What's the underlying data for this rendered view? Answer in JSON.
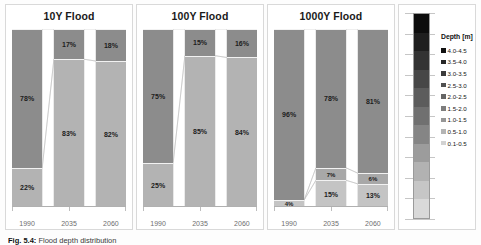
{
  "figure": {
    "caption_label": "Fig. 5.4:",
    "caption_text": "Flood depth distribution"
  },
  "chart_data": {
    "type": "bar",
    "subtype": "100% stacked column with connector ribbons",
    "title": "Flood depth distribution",
    "categories": [
      "1990",
      "2035",
      "2060"
    ],
    "xlabel": "",
    "ylabel": "",
    "ylim": [
      0,
      100
    ],
    "grid": false,
    "legend_position": "right",
    "panels": [
      {
        "title": "10Y Flood",
        "series": [
          {
            "name": "0.1-0.5",
            "values": [
              22,
              83,
              82
            ]
          },
          {
            "name": "0.5-1.0",
            "values": [
              78,
              17,
              18
            ]
          },
          {
            "name": "1.0-1.5",
            "values": [
              0,
              0,
              0
            ]
          }
        ],
        "bars": [
          {
            "category": "1990",
            "segments": [
              {
                "label": "0%",
                "value": 0,
                "color": "#808080",
                "outside": true
              },
              {
                "label": "78%",
                "value": 78,
                "color": "#8c8c8c"
              },
              {
                "label": "22%",
                "value": 22,
                "color": "#b3b3b3"
              }
            ]
          },
          {
            "category": "2035",
            "segments": [
              {
                "label": "0%",
                "value": 0,
                "color": "#808080",
                "outside": true
              },
              {
                "label": "17%",
                "value": 17,
                "color": "#8c8c8c"
              },
              {
                "label": "83%",
                "value": 83,
                "color": "#b3b3b3"
              }
            ]
          },
          {
            "category": "2060",
            "segments": [
              {
                "label": "0%",
                "value": 0,
                "color": "#808080",
                "outside": true
              },
              {
                "label": "18%",
                "value": 18,
                "color": "#8c8c8c"
              },
              {
                "label": "82%",
                "value": 82,
                "color": "#b3b3b3"
              }
            ]
          }
        ]
      },
      {
        "title": "100Y Flood",
        "series": [
          {
            "name": "0.1-0.5",
            "values": [
              25,
              85,
              84
            ]
          },
          {
            "name": "0.5-1.0",
            "values": [
              75,
              15,
              16
            ]
          },
          {
            "name": "1.0-1.5",
            "values": [
              0,
              0,
              0
            ]
          }
        ],
        "bars": [
          {
            "category": "1990",
            "segments": [
              {
                "label": "75%",
                "value": 75,
                "color": "#8c8c8c"
              },
              {
                "label": "25%",
                "value": 25,
                "color": "#b3b3b3"
              },
              {
                "label": "0%",
                "value": 0,
                "color": "#cfcfcf",
                "outside": true
              }
            ]
          },
          {
            "category": "2035",
            "segments": [
              {
                "label": "15%",
                "value": 15,
                "color": "#8c8c8c"
              },
              {
                "label": "85%",
                "value": 85,
                "color": "#b3b3b3"
              },
              {
                "label": "0%",
                "value": 0,
                "color": "#cfcfcf",
                "outside": true
              }
            ]
          },
          {
            "category": "2060",
            "segments": [
              {
                "label": "16%",
                "value": 16,
                "color": "#8c8c8c"
              },
              {
                "label": "84%",
                "value": 84,
                "color": "#b3b3b3"
              },
              {
                "label": "0%",
                "value": 0,
                "color": "#cfcfcf",
                "outside": true
              }
            ]
          }
        ]
      },
      {
        "title": "1000Y Flood",
        "series": [
          {
            "name": "0.1-0.5",
            "values": [
              4,
              15,
              13
            ]
          },
          {
            "name": "0.5-1.0",
            "values": [
              0,
              7,
              6
            ]
          },
          {
            "name": "1.0-1.5",
            "values": [
              96,
              78,
              81
            ]
          }
        ],
        "bars": [
          {
            "category": "1990",
            "segments": [
              {
                "label": "96%",
                "value": 96,
                "color": "#8c8c8c"
              },
              {
                "label": "0%",
                "value": 0,
                "color": "#a8a8a8",
                "outside": false
              },
              {
                "label": "4%",
                "value": 4,
                "color": "#c4c4c4"
              }
            ]
          },
          {
            "category": "2035",
            "segments": [
              {
                "label": "78%",
                "value": 78,
                "color": "#8c8c8c"
              },
              {
                "label": "7%",
                "value": 7,
                "color": "#a8a8a8"
              },
              {
                "label": "15%",
                "value": 15,
                "color": "#c4c4c4"
              }
            ]
          },
          {
            "category": "2060",
            "segments": [
              {
                "label": "81%",
                "value": 81,
                "color": "#8c8c8c"
              },
              {
                "label": "6%",
                "value": 6,
                "color": "#a8a8a8"
              },
              {
                "label": "13%",
                "value": 13,
                "color": "#c4c4c4"
              }
            ]
          }
        ]
      }
    ],
    "legend": {
      "title": "Depth [m]",
      "items": [
        {
          "label": "4.0-4.5",
          "color": "#111111"
        },
        {
          "label": "3.5-4.0",
          "color": "#262626"
        },
        {
          "label": "3.0-3.5",
          "color": "#3b3b3b"
        },
        {
          "label": "2.5-3.0",
          "color": "#505050"
        },
        {
          "label": "2.0-2.5",
          "color": "#656565"
        },
        {
          "label": "1.5-2.0",
          "color": "#7d7d7d"
        },
        {
          "label": "1.0-1.5",
          "color": "#969696"
        },
        {
          "label": "0.5-1.0",
          "color": "#b4b4b4"
        },
        {
          "label": "0.1-0.5",
          "color": "#d2d2d2"
        }
      ],
      "colorbar_stops": [
        "#0d0d0d",
        "#1f1f1f",
        "#333333",
        "#474747",
        "#5c5c5c",
        "#707070",
        "#858585",
        "#9c9c9c",
        "#b2b2b2",
        "#c6c6c6",
        "#d9d9d9"
      ]
    }
  }
}
